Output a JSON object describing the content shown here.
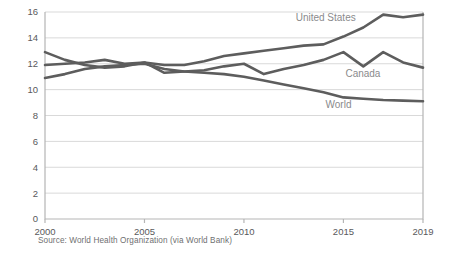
{
  "source_note": "Source: World Health Organization (via World Bank)",
  "labels": {
    "united_states": "United States",
    "canada": "Canada",
    "world": "World"
  },
  "colors": {
    "line": "#5d5d5d",
    "grid": "#d9d9d9",
    "axis": "#b5b5b5",
    "tick_text": "#59595b",
    "series_text": "#8a8a8c",
    "background": "#ffffff"
  },
  "chart_data": {
    "type": "line",
    "title": "",
    "subtitle": "",
    "xlabel": "",
    "ylabel": "",
    "xlim": [
      2000,
      2019
    ],
    "ylim": [
      0,
      16
    ],
    "grid": true,
    "legend_position": "inline-right",
    "y_ticks": [
      0,
      2,
      4,
      6,
      8,
      10,
      12,
      14,
      16
    ],
    "x_ticks": [
      2000,
      2005,
      2010,
      2015,
      2019
    ],
    "x": [
      2000,
      2001,
      2002,
      2003,
      2004,
      2005,
      2006,
      2007,
      2008,
      2009,
      2010,
      2011,
      2012,
      2013,
      2014,
      2015,
      2016,
      2017,
      2018,
      2019
    ],
    "series": [
      {
        "name": "United States",
        "values": [
          11.9,
          12.0,
          12.1,
          12.3,
          12.0,
          12.1,
          11.9,
          11.9,
          12.2,
          12.6,
          12.8,
          13.0,
          13.2,
          13.4,
          13.5,
          14.1,
          14.8,
          15.8,
          15.6,
          15.8
        ],
        "label_anchor": {
          "x": 2012.6,
          "y": 15.3
        }
      },
      {
        "name": "Canada",
        "values": [
          12.9,
          12.3,
          11.9,
          11.7,
          11.8,
          12.1,
          11.3,
          11.4,
          11.5,
          11.8,
          12.0,
          11.2,
          11.6,
          11.9,
          12.3,
          12.9,
          11.8,
          12.9,
          12.1,
          11.7
        ],
        "label_anchor": {
          "x": 2015.1,
          "y": 11.0
        }
      },
      {
        "name": "World",
        "values": [
          10.9,
          11.2,
          11.6,
          11.8,
          11.9,
          12.0,
          11.6,
          11.4,
          11.3,
          11.2,
          11.0,
          10.7,
          10.4,
          10.1,
          9.8,
          9.4,
          9.3,
          9.2,
          9.15,
          9.1
        ],
        "label_anchor": {
          "x": 2014.1,
          "y": 8.6
        }
      }
    ]
  }
}
